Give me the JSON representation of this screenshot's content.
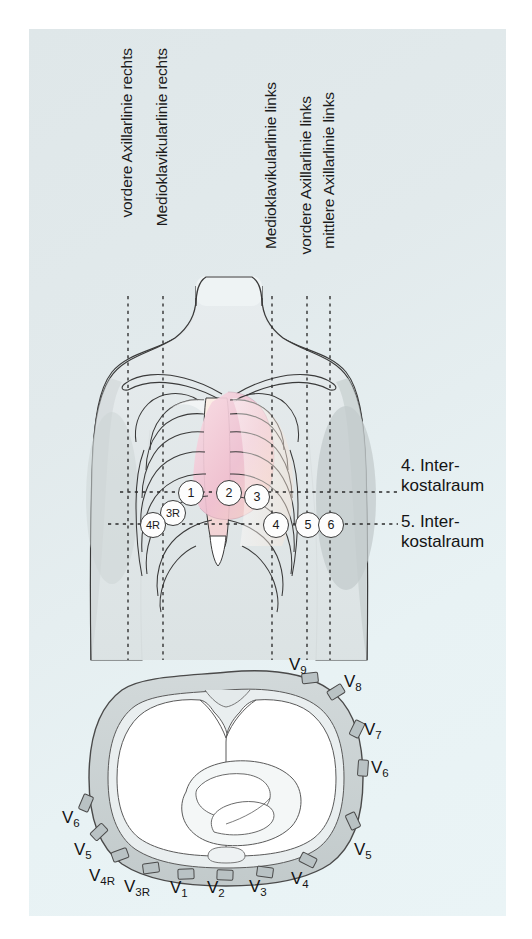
{
  "figure": {
    "background_color": "#ffffff",
    "panel_color": "#e3ebed"
  },
  "vertical_lines": [
    {
      "id": "vordere-axillarlinie-rechts",
      "label": "vordere Axillarlinie rechts",
      "x": 128
    },
    {
      "id": "medioklavikularlinie-rechts",
      "label": "Medioklavikularlinie rechts",
      "x": 163
    },
    {
      "id": "medioklavikularlinie-links",
      "label": "Medioklavikularlinie links",
      "x": 272
    },
    {
      "id": "vordere-axillarlinie-links",
      "label": "vordere Axillarlinie links",
      "x": 307
    },
    {
      "id": "mittlere-axillarlinie-links",
      "label": "mittlere Axillarlinie links",
      "x": 330
    }
  ],
  "intercostal_spaces": [
    {
      "id": "ics4",
      "line1": "4. Inter-",
      "line2": "kostalraum",
      "y": 492
    },
    {
      "id": "ics5",
      "line1": "5. Inter-",
      "line2": "kostalraum",
      "y": 523
    }
  ],
  "electrodes_front": [
    {
      "label": "1",
      "x": 190,
      "y": 492,
      "r": 12
    },
    {
      "label": "2",
      "x": 228,
      "y": 492,
      "r": 12
    },
    {
      "label": "3R",
      "x": 172,
      "y": 512,
      "r": 12
    },
    {
      "label": "3",
      "x": 256,
      "y": 496,
      "r": 12
    },
    {
      "label": "4R",
      "x": 152,
      "y": 524,
      "r": 12
    },
    {
      "label": "4",
      "x": 275,
      "y": 524,
      "r": 12
    },
    {
      "label": "5",
      "x": 307,
      "y": 524,
      "r": 12
    },
    {
      "label": "6",
      "x": 330,
      "y": 524,
      "r": 12
    }
  ],
  "cross_section": {
    "caption": "Thoraxquerschnitt mit Elektrodenpositionen",
    "leads": [
      {
        "label": "V",
        "sub": "9",
        "text": "V9",
        "pad_x": 310,
        "pad_y": 678,
        "pad_rot": -6,
        "lbl_x": 289,
        "lbl_y": 655
      },
      {
        "label": "V",
        "sub": "8",
        "text": "V8",
        "pad_x": 336,
        "pad_y": 692,
        "pad_rot": -32,
        "lbl_x": 344,
        "lbl_y": 672
      },
      {
        "label": "V",
        "sub": "7",
        "text": "V7",
        "pad_x": 357,
        "pad_y": 729,
        "pad_rot": -64,
        "lbl_x": 364,
        "lbl_y": 720
      },
      {
        "label": "V",
        "sub": "6",
        "text": "V6",
        "pad_x": 363,
        "pad_y": 768,
        "pad_rot": -86,
        "lbl_x": 371,
        "lbl_y": 758
      },
      {
        "label": "V",
        "sub": "5",
        "text": "V5",
        "pad_x": 353,
        "pad_y": 821,
        "pad_rot": -115,
        "lbl_x": 354,
        "lbl_y": 840
      },
      {
        "label": "V",
        "sub": "4",
        "text": "V4",
        "pad_x": 308,
        "pad_y": 860,
        "pad_rot": -153,
        "lbl_x": 291,
        "lbl_y": 869
      },
      {
        "label": "V",
        "sub": "3",
        "text": "V3",
        "pad_x": 265,
        "pad_y": 872,
        "pad_rot": -172,
        "lbl_x": 249,
        "lbl_y": 877
      },
      {
        "label": "V",
        "sub": "2",
        "text": "V2",
        "pad_x": 225,
        "pad_y": 875,
        "pad_rot": -178,
        "lbl_x": 207,
        "lbl_y": 878
      },
      {
        "label": "V",
        "sub": "1",
        "text": "V1",
        "pad_x": 186,
        "pad_y": 874,
        "pad_rot": 178,
        "lbl_x": 170,
        "lbl_y": 878
      },
      {
        "label": "V",
        "sub": "3R",
        "text": "V3R",
        "pad_x": 151,
        "pad_y": 868,
        "pad_rot": 172,
        "lbl_x": 124,
        "lbl_y": 877
      },
      {
        "label": "V",
        "sub": "4R",
        "text": "V4R",
        "pad_x": 120,
        "pad_y": 855,
        "pad_rot": 160,
        "lbl_x": 89,
        "lbl_y": 866
      },
      {
        "label": "V",
        "sub": "5",
        "text": "V5",
        "pad_x": 99,
        "pad_y": 832,
        "pad_rot": 137,
        "lbl_x": 74,
        "lbl_y": 840
      },
      {
        "label": "V",
        "sub": "6",
        "text": "V6",
        "pad_x": 86,
        "pad_y": 803,
        "pad_rot": 113,
        "lbl_x": 62,
        "lbl_y": 808
      }
    ]
  },
  "colors": {
    "outline": "#3a3a3a",
    "body_fill": "#e0e5e6",
    "wall_fill": "#c9d1d2",
    "lung_fill": "#ffffff",
    "heart_pink": "#f2c9d6",
    "rib_beige": "#f4ded0",
    "pad_fill": "#b9c2c4",
    "dash": "#2b2b2b"
  }
}
